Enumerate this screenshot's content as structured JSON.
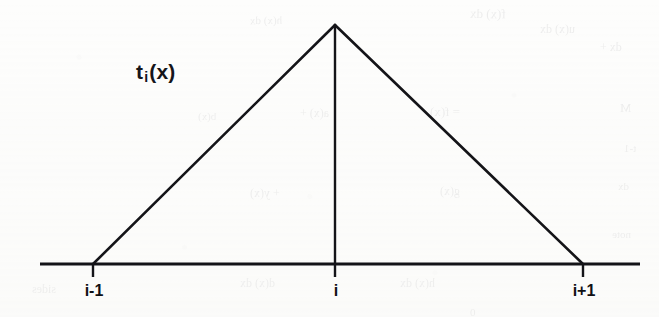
{
  "figure": {
    "type": "line-diagram",
    "title": "",
    "background_color": "#fdfdfc",
    "ink_color": "#141418",
    "function_label": {
      "base": "t",
      "subscript": "i",
      "argument": "(x)"
    },
    "axis": {
      "x_start_px": 40,
      "x_end_px": 640,
      "y_px": 264,
      "stroke_width": 2.6
    },
    "ticks": [
      {
        "name": "left",
        "label": "i-1",
        "x_px": 93
      },
      {
        "name": "mid",
        "label": "i",
        "x_px": 335
      },
      {
        "name": "right",
        "label": "i+1",
        "x_px": 583
      }
    ],
    "apex": {
      "x_px": 335,
      "y_px": 25
    },
    "bleed_through_fragments": [
      {
        "text": "f(x) dx",
        "x": 470,
        "y": 6,
        "size": 13,
        "rot": -1
      },
      {
        "text": "u(x) dx",
        "x": 540,
        "y": 22,
        "size": 12,
        "rot": 0
      },
      {
        "text": "dx +",
        "x": 600,
        "y": 40,
        "size": 12,
        "rot": 0
      },
      {
        "text": "h(x) dx",
        "x": 250,
        "y": 14,
        "size": 11,
        "rot": 1
      },
      {
        "text": "= f(x)",
        "x": 430,
        "y": 104,
        "size": 13,
        "rot": 0
      },
      {
        "text": "a(x) +",
        "x": 300,
        "y": 106,
        "size": 12,
        "rot": 0
      },
      {
        "text": "b(x)",
        "x": 198,
        "y": 110,
        "size": 11,
        "rot": 0
      },
      {
        "text": "M",
        "x": 620,
        "y": 100,
        "size": 13,
        "rot": 0
      },
      {
        "text": "t-1",
        "x": 624,
        "y": 142,
        "size": 11,
        "rot": 0
      },
      {
        "text": "dx",
        "x": 618,
        "y": 180,
        "size": 11,
        "rot": 0
      },
      {
        "text": "g(x)",
        "x": 440,
        "y": 184,
        "size": 12,
        "rot": 0
      },
      {
        "text": "+ y(x)",
        "x": 250,
        "y": 186,
        "size": 12,
        "rot": 0
      },
      {
        "text": "note",
        "x": 612,
        "y": 228,
        "size": 11,
        "rot": 0
      },
      {
        "text": "d(x) dx",
        "x": 240,
        "y": 276,
        "size": 12,
        "rot": 0
      },
      {
        "text": "h(x) dx",
        "x": 400,
        "y": 276,
        "size": 12,
        "rot": 0
      },
      {
        "text": "sides",
        "x": 32,
        "y": 282,
        "size": 12,
        "rot": 0
      },
      {
        "text": "0",
        "x": 470,
        "y": 306,
        "size": 11,
        "rot": 0
      }
    ]
  },
  "chart_data": {
    "type": "line",
    "xlabel": "",
    "ylabel": "",
    "series": [
      {
        "name": "t_i(x)",
        "x": [
          "i-1",
          "i",
          "i+1"
        ],
        "values": [
          0,
          1,
          0
        ]
      }
    ],
    "annotations": [
      "t_i(x)"
    ],
    "tick_labels": [
      "i-1",
      "i",
      "i+1"
    ],
    "grid": false,
    "legend": "none"
  }
}
